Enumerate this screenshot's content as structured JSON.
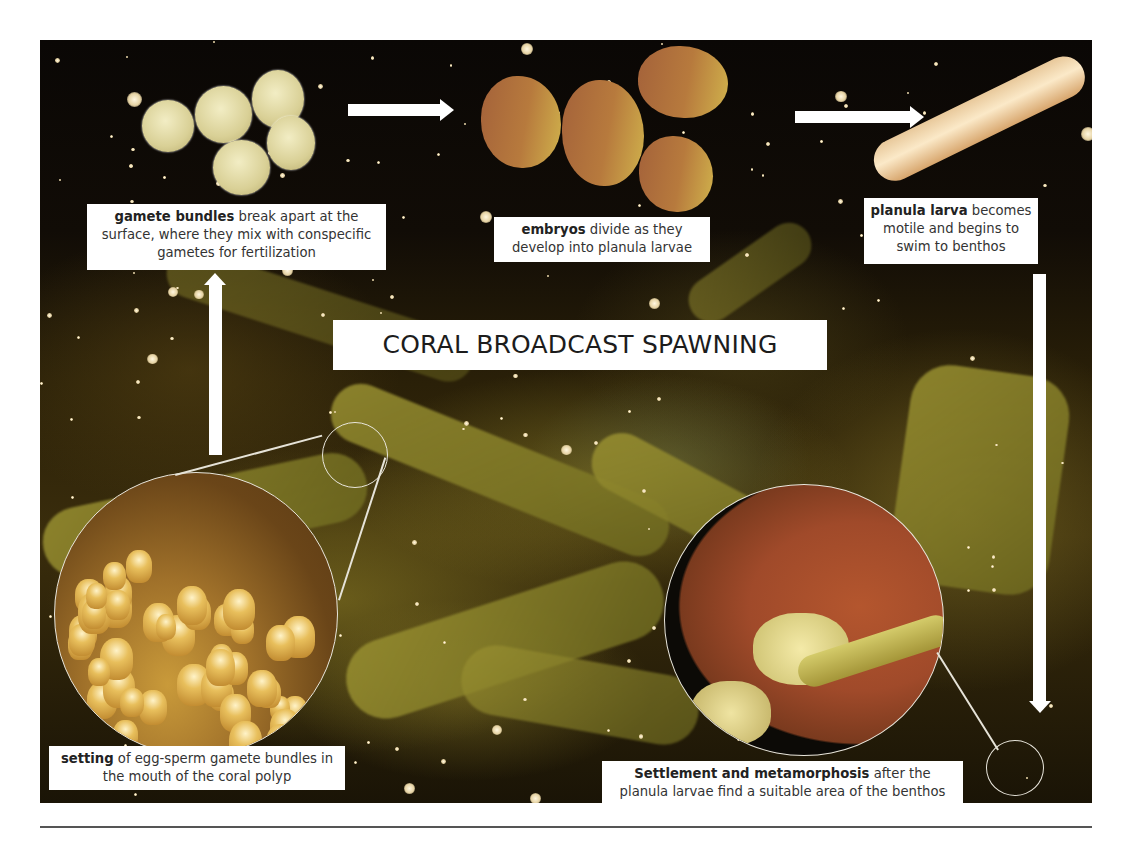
{
  "diagram": {
    "title": "CORAL BROADCAST SPAWNING",
    "steps": [
      {
        "id": "gamete-bundles",
        "bold": "gamete bundles",
        "text": " break apart at the surface, where they mix with conspecific gametes for fertilization"
      },
      {
        "id": "embryos",
        "bold": "embryos",
        "text": " divide as they develop into planula larvae"
      },
      {
        "id": "planula-larva",
        "bold": "planula larva",
        "text": " becomes motile and begins to swim to benthos"
      },
      {
        "id": "settlement",
        "bold": "Settlement and metamorphosis",
        "text": " after the planula larvae find a suitable area of the benthos"
      },
      {
        "id": "setting",
        "bold": "setting",
        "text": " of egg-sperm gamete bundles in the mouth of the coral polyp"
      }
    ],
    "flow": [
      "setting",
      "gamete-bundles",
      "embryos",
      "planula-larva",
      "settlement"
    ],
    "arrows": [
      {
        "from": "gamete-bundles",
        "to": "embryos",
        "direction": "right"
      },
      {
        "from": "embryos",
        "to": "planula-larva",
        "direction": "right"
      },
      {
        "from": "planula-larva",
        "to": "settlement",
        "direction": "down"
      },
      {
        "from": "setting",
        "to": "gamete-bundles",
        "direction": "up"
      }
    ],
    "insets": [
      {
        "id": "polyp-closeup",
        "depicts": "coral polyps with gamete bundles"
      },
      {
        "id": "settlement-closeup",
        "depicts": "planula larva settling on benthos"
      }
    ],
    "background": "photo of branching coral colony spawning at night"
  },
  "colors": {
    "label_bg": "#ffffff",
    "label_text": "#333333",
    "arrow": "#ffffff"
  }
}
